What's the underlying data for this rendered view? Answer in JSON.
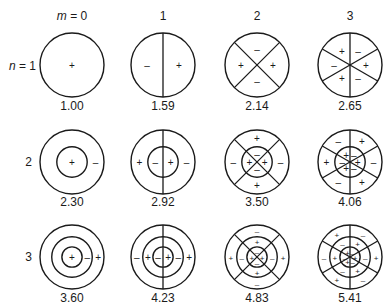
{
  "column_headers": [
    {
      "prefix": "m",
      "eq": " = ",
      "value": "0"
    },
    {
      "prefix": "",
      "eq": "",
      "value": "1"
    },
    {
      "prefix": "",
      "eq": "",
      "value": "2"
    },
    {
      "prefix": "",
      "eq": "",
      "value": "3"
    }
  ],
  "row_headers": [
    {
      "prefix": "n",
      "eq": " = ",
      "value": "1"
    },
    {
      "prefix": "",
      "eq": "",
      "value": "2"
    },
    {
      "prefix": "",
      "eq": "",
      "value": "3"
    }
  ],
  "modes": [
    [
      {
        "m": 0,
        "n": 1,
        "value": "1.00"
      },
      {
        "m": 1,
        "n": 1,
        "value": "1.59"
      },
      {
        "m": 2,
        "n": 1,
        "value": "2.14"
      },
      {
        "m": 3,
        "n": 1,
        "value": "2.65"
      }
    ],
    [
      {
        "m": 0,
        "n": 2,
        "value": "2.30"
      },
      {
        "m": 1,
        "n": 2,
        "value": "2.92"
      },
      {
        "m": 2,
        "n": 2,
        "value": "3.50"
      },
      {
        "m": 3,
        "n": 2,
        "value": "4.06"
      }
    ],
    [
      {
        "m": 0,
        "n": 3,
        "value": "3.60"
      },
      {
        "m": 1,
        "n": 3,
        "value": "4.23"
      },
      {
        "m": 2,
        "n": 3,
        "value": "4.83"
      },
      {
        "m": 3,
        "n": 3,
        "value": "5.41"
      }
    ]
  ],
  "colors": {
    "line": "#1a1a1a",
    "background": "#ffffff"
  },
  "signs": {
    "plus": "+",
    "minus": "–"
  }
}
